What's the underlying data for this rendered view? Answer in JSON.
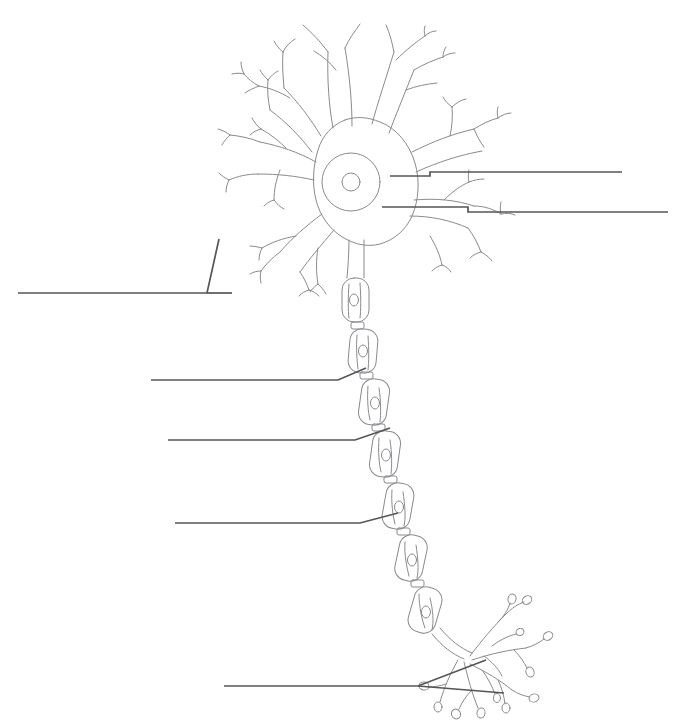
{
  "page": {
    "width": 674,
    "height": 724,
    "background_color": "#ffffff",
    "kind": "unlabeled-anatomy-worksheet",
    "header_fragment": ""
  },
  "colors": {
    "drawing_stroke": "#8a8a90",
    "drawing_stroke_light": "#9b9ba1",
    "leader_line": "#555558",
    "background": "#ffffff",
    "header_text": "#d8d8dc"
  },
  "figure": {
    "name": "multipolar-neuron",
    "parts": [
      {
        "id": "dendrites",
        "label": ""
      },
      {
        "id": "soma",
        "label": ""
      },
      {
        "id": "nucleus",
        "label": ""
      },
      {
        "id": "nucleolus",
        "label": ""
      },
      {
        "id": "axon-hillock",
        "label": ""
      },
      {
        "id": "axon",
        "label": ""
      },
      {
        "id": "myelin-sheath",
        "label": ""
      },
      {
        "id": "schwann-cell-nucleus",
        "label": ""
      },
      {
        "id": "node-of-ranvier",
        "label": ""
      },
      {
        "id": "axon-terminals",
        "label": ""
      },
      {
        "id": "synaptic-boutons",
        "label": ""
      }
    ]
  },
  "leader_lines": [
    {
      "id": "leader-right-upper",
      "label": "",
      "side": "right",
      "shape": "stepped",
      "points": "390,176 430,176 430,172 622,172",
      "target": "nucleolus"
    },
    {
      "id": "leader-right-lower",
      "label": "",
      "side": "right",
      "shape": "stepped",
      "points": "382,207 468,207 468,212 668,212",
      "target": "nucleus"
    },
    {
      "id": "leader-left-dendrite-bracket",
      "label": "",
      "side": "left",
      "shape": "bracket",
      "points": "18,293 207,293 219,239",
      "target": "dendrites"
    },
    {
      "id": "leader-left-myelin",
      "label": "",
      "side": "left",
      "shape": "angled",
      "points": "151,380 338,380 366,368",
      "target": "myelin-sheath"
    },
    {
      "id": "leader-left-schwann",
      "label": "",
      "side": "left",
      "shape": "angled",
      "points": "168,440 355,440 390,428",
      "target": "schwann-cell-nucleus"
    },
    {
      "id": "leader-left-node",
      "label": "",
      "side": "left",
      "shape": "angled",
      "points": "175,523 360,523 398,513",
      "target": "node-of-ranvier"
    },
    {
      "id": "leader-bottom-terminals",
      "label": "",
      "side": "bottom",
      "shape": "fork",
      "points": "224,686 418,686 486,660 502,692",
      "target": "axon-terminals"
    }
  ]
}
